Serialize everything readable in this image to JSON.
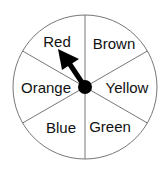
{
  "spinner": {
    "sections": [
      {
        "label": "Red"
      },
      {
        "label": "Brown"
      },
      {
        "label": "Yellow"
      },
      {
        "label": "Green"
      },
      {
        "label": "Blue"
      },
      {
        "label": "Orange"
      }
    ],
    "pointer_points_to": "Red",
    "colors": {
      "outline": "#777777",
      "pointer": "#000000",
      "text": "#111111"
    }
  }
}
